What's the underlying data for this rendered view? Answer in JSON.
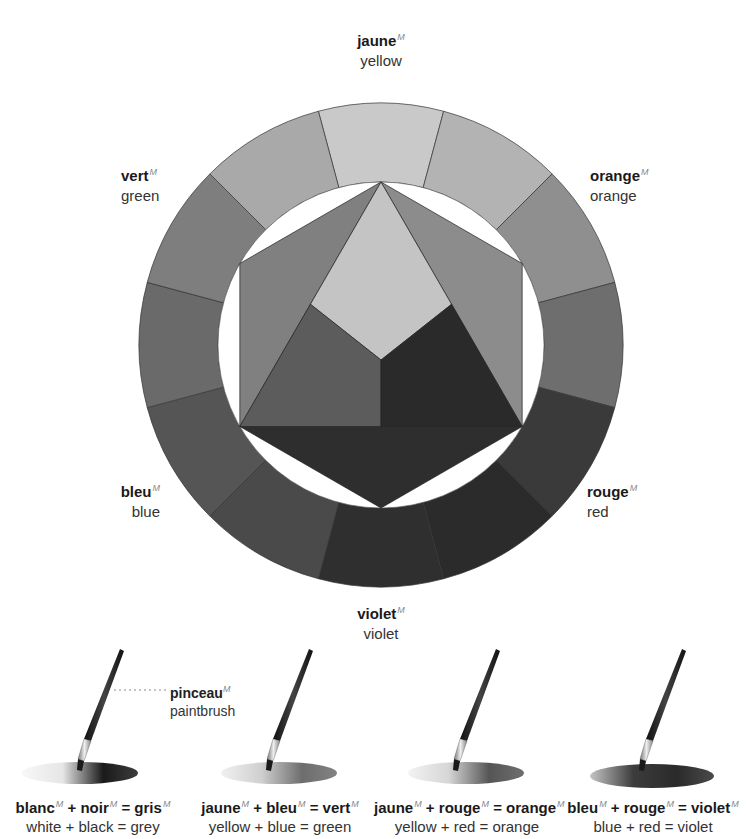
{
  "wheel": {
    "center": [
      381,
      345
    ],
    "outer_radius": 242,
    "inner_radius": 163,
    "segments": [
      {
        "name": "yellow",
        "color": "#c9c9c9"
      },
      {
        "name": "yellow-orange",
        "color": "#b3b3b3"
      },
      {
        "name": "orange",
        "color": "#8f8f8f"
      },
      {
        "name": "red-orange",
        "color": "#6e6e6e"
      },
      {
        "name": "red",
        "color": "#3a3a3a"
      },
      {
        "name": "red-violet",
        "color": "#2b2b2b"
      },
      {
        "name": "violet",
        "color": "#2f2f2f"
      },
      {
        "name": "blue-violet",
        "color": "#4a4a4a"
      },
      {
        "name": "blue",
        "color": "#555555"
      },
      {
        "name": "blue-green",
        "color": "#6a6a6a"
      },
      {
        "name": "green",
        "color": "#7e7e7e"
      },
      {
        "name": "yellow-green",
        "color": "#a9a9a9"
      }
    ],
    "inner": {
      "yellow_triangle": "#c4c4c4",
      "blue_triangle": "#5c5c5c",
      "red_triangle": "#2a2a2a",
      "green_side": "#808080",
      "orange_side": "#8c8c8c",
      "violet_side": "#2e2e2e"
    }
  },
  "labels": {
    "yellow": {
      "fr": "jaune",
      "gender": "M",
      "en": "yellow"
    },
    "green": {
      "fr": "vert",
      "gender": "M",
      "en": "green"
    },
    "orange": {
      "fr": "orange",
      "gender": "M",
      "en": "orange"
    },
    "blue": {
      "fr": "bleu",
      "gender": "M",
      "en": "blue"
    },
    "red": {
      "fr": "rouge",
      "gender": "M",
      "en": "red"
    },
    "violet": {
      "fr": "violet",
      "gender": "M",
      "en": "violet"
    }
  },
  "brush_label": {
    "fr": "pinceau",
    "gender": "M",
    "en": "paintbrush"
  },
  "mixes": [
    {
      "a": "blanc",
      "b": "noir",
      "result": "gris",
      "gender": "M",
      "en": "white + black = grey",
      "colors": [
        "#e6e6e6",
        "#1a1a1a"
      ]
    },
    {
      "a": "jaune",
      "b": "bleu",
      "result": "vert",
      "gender": "M",
      "en": "yellow + blue = green",
      "colors": [
        "#cfcfcf",
        "#6d6d6d"
      ]
    },
    {
      "a": "jaune",
      "b": "rouge",
      "result": "orange",
      "gender": "M",
      "en": "yellow + red = orange",
      "colors": [
        "#d6d6d6",
        "#555555"
      ]
    },
    {
      "a": "bleu",
      "b": "rouge",
      "result": "violet",
      "gender": "M",
      "en": "blue + red = violet",
      "colors": [
        "#3c3c3c",
        "#2a2a2a"
      ]
    }
  ],
  "symbols": {
    "plus": "+",
    "equals": "="
  }
}
